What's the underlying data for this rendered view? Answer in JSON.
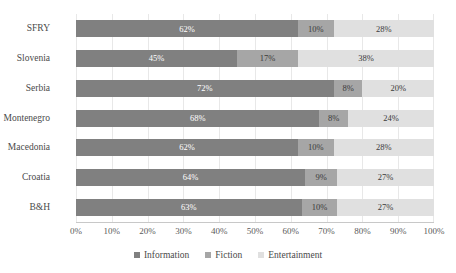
{
  "chart_data": {
    "type": "bar",
    "subtype": "stacked-bar-100-horizontal",
    "orientation": "horizontal",
    "title": "",
    "subtitle": "",
    "xlabel": "",
    "ylabel": "",
    "xlim": [
      0,
      100
    ],
    "grid": true,
    "grid_axis": "x",
    "legend_position": "bottom",
    "value_suffix": "%",
    "categories": [
      "SFRY",
      "Slovenia",
      "Serbia",
      "Montenegro",
      "Macedonia",
      "Croatia",
      "B&H"
    ],
    "tick_labels": [
      "0%",
      "10%",
      "20%",
      "30%",
      "40%",
      "50%",
      "60%",
      "70%",
      "80%",
      "90%",
      "100%"
    ],
    "tick_values": [
      0,
      10,
      20,
      30,
      40,
      50,
      60,
      70,
      80,
      90,
      100
    ],
    "series": [
      {
        "name": "Information",
        "color": "#808080",
        "label_color": "#ffffff",
        "values": [
          62,
          45,
          72,
          68,
          62,
          64,
          63
        ],
        "data_labels": [
          "62%",
          "45%",
          "72%",
          "68%",
          "62%",
          "64%",
          "63%"
        ]
      },
      {
        "name": "Fiction",
        "color": "#a6a6a6",
        "label_color": "#3a3a3a",
        "values": [
          10,
          17,
          8,
          8,
          10,
          9,
          10
        ],
        "data_labels": [
          "10%",
          "17%",
          "8%",
          "8%",
          "10%",
          "9%",
          "10%"
        ]
      },
      {
        "name": "Entertainment",
        "color": "#e0e0e0",
        "label_color": "#3a3a3a",
        "values": [
          28,
          38,
          20,
          24,
          28,
          27,
          27
        ],
        "data_labels": [
          "28%",
          "38%",
          "20%",
          "24%",
          "28%",
          "27%",
          "27%"
        ]
      }
    ]
  },
  "legend": {
    "items": [
      {
        "label": "Information",
        "color": "#808080"
      },
      {
        "label": "Fiction",
        "color": "#a6a6a6"
      },
      {
        "label": "Entertainment",
        "color": "#e0e0e0"
      }
    ]
  }
}
